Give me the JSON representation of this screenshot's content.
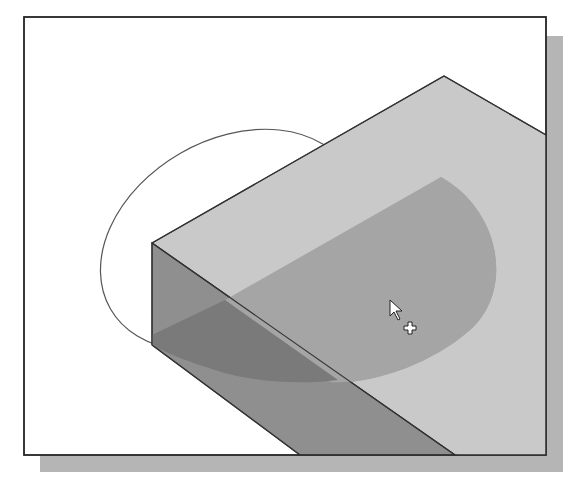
{
  "figure": {
    "colors": {
      "background": "#ffffff",
      "frame_border": "#2b2b2b",
      "frame_shadow": "#b5b5b5",
      "top_face": "#c9c9c9",
      "front_face": "#8f8f8f",
      "profile_on_top": "#a5a5a5",
      "profile_on_front": "#7a7a7a",
      "edge": "#333333",
      "ellipse_outline": "#555555"
    },
    "cursor": {
      "type": "arrow-with-plus",
      "x": 392,
      "y": 302
    }
  }
}
